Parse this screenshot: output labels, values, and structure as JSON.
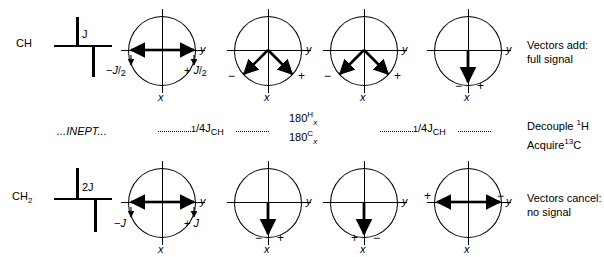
{
  "figure": {
    "type": "nmr-vector-diagram",
    "title_rows": [
      "CH",
      "CH2"
    ],
    "rows": [
      {
        "id": "ch-row",
        "label": "CH",
        "multiplet": {
          "splitting_label": "J",
          "lines": [
            {
              "direction": "up"
            },
            {
              "direction": "down"
            }
          ]
        },
        "panels": [
          {
            "id": "ch-panel-1",
            "axis_y": "y",
            "axis_x": "x",
            "vectors": [
              {
                "angle_deg": 0,
                "label": "+ J/2",
                "sign": "+"
              },
              {
                "angle_deg": 180,
                "label": "- J/2",
                "sign": "-"
              }
            ],
            "left_label": {
              "sign": "−",
              "num": "J",
              "den": "2"
            },
            "right_label": {
              "sign": "+",
              "num": "J",
              "den": "2"
            }
          },
          {
            "id": "ch-panel-2",
            "axis_y": "y",
            "axis_x": "x",
            "vectors": [
              {
                "angle_deg": 225,
                "sign": "−"
              },
              {
                "angle_deg": 315,
                "sign": "+"
              }
            ],
            "minus_label": "−",
            "plus_label": "+"
          },
          {
            "id": "ch-panel-3",
            "axis_y": "y",
            "axis_x": "x",
            "vectors": [
              {
                "angle_deg": 225,
                "sign": "−"
              },
              {
                "angle_deg": 315,
                "sign": "+"
              }
            ],
            "minus_label": "−",
            "plus_label": "+"
          },
          {
            "id": "ch-panel-4",
            "axis_y": "y",
            "axis_x": "x",
            "vectors": [
              {
                "angle_deg": 270,
                "sign": "both"
              }
            ],
            "minus_label": "−",
            "plus_label": "+"
          }
        ],
        "caption_line1": "Vectors add:",
        "caption_line2": "full signal"
      },
      {
        "id": "ch2-row",
        "label": "CH",
        "label_sub": "2",
        "multiplet": {
          "splitting_label": "2J",
          "lines": [
            {
              "direction": "up"
            },
            {
              "direction": "down"
            }
          ]
        },
        "panels": [
          {
            "id": "ch2-panel-1",
            "axis_y": "y",
            "axis_x": "x",
            "vectors": [
              {
                "angle_deg": 0,
                "sign": "+"
              },
              {
                "angle_deg": 180,
                "sign": "−"
              }
            ],
            "left_label": {
              "sign": "−",
              "num": "J",
              "den": ""
            },
            "right_label": {
              "sign": "+",
              "num": "J",
              "den": ""
            }
          },
          {
            "id": "ch2-panel-2",
            "axis_y": "y",
            "axis_x": "x",
            "vectors": [
              {
                "angle_deg": 270,
                "sign": "both"
              }
            ],
            "minus_label": "−",
            "plus_label": "+"
          },
          {
            "id": "ch2-panel-3",
            "axis_y": "y",
            "axis_x": "x",
            "vectors": [
              {
                "angle_deg": 270,
                "sign": "both"
              }
            ],
            "minus_label": "+",
            "plus_label": "−"
          },
          {
            "id": "ch2-panel-4",
            "axis_y": "y",
            "axis_x": "x",
            "vectors": [
              {
                "angle_deg": 0,
                "sign": "−"
              },
              {
                "angle_deg": 180,
                "sign": "+"
              }
            ],
            "minus_label": "+",
            "plus_label": "−"
          }
        ],
        "caption_line1": "Vectors cancel:",
        "caption_line2": "no signal"
      }
    ],
    "sequence": {
      "inept": "...INEPT...",
      "delay1": {
        "numerator": "1",
        "slash": "/",
        "denominator": "4J",
        "subscript": "CH"
      },
      "delay2": {
        "numerator": "1",
        "slash": "/",
        "denominator": "4J",
        "subscript": "CH"
      },
      "pulse_h": {
        "value": "180",
        "nucleus": "H",
        "phase": "x"
      },
      "pulse_c": {
        "value": "180",
        "nucleus": "C",
        "phase": "x"
      },
      "decouple": {
        "text": "Decouple ",
        "sup": "1",
        "nucleus": "H"
      },
      "acquire": {
        "text": "Acquire",
        "sup": "13",
        "nucleus": "C"
      }
    },
    "colors": {
      "ink": "#000000",
      "background": "#ffffff"
    }
  }
}
